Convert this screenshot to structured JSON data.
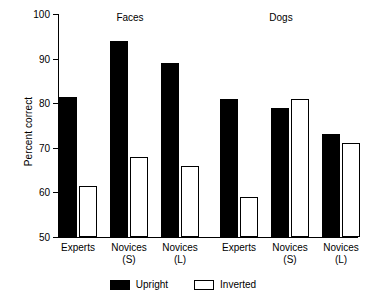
{
  "chart_data": {
    "type": "bar",
    "title": "",
    "xlabel": "",
    "ylabel": "Percent correct",
    "ylim": [
      50,
      100
    ],
    "yticks": [
      50,
      60,
      70,
      80,
      90,
      100
    ],
    "grid": false,
    "legend_position": "bottom-center",
    "groups": [
      {
        "name": "Faces",
        "categories": [
          "Experts",
          "Novices\n(S)",
          "Novices\n(L)"
        ]
      },
      {
        "name": "Dogs",
        "categories": [
          "Experts",
          "Novices\n(S)",
          "Novices\n(L)"
        ]
      }
    ],
    "categories": [
      "Faces / Experts",
      "Faces / Novices (S)",
      "Faces / Novices (L)",
      "Dogs / Experts",
      "Dogs / Novices (S)",
      "Dogs / Novices (L)"
    ],
    "series": [
      {
        "name": "Upright",
        "color": "#000000",
        "values": [
          81.5,
          94,
          89,
          81,
          79,
          73
        ]
      },
      {
        "name": "Inverted",
        "color": "#ffffff",
        "values": [
          61.5,
          68,
          66,
          59,
          81,
          71
        ]
      }
    ]
  },
  "axis": {
    "y_label": "Percent correct",
    "y_ticks": [
      "100",
      "90",
      "80",
      "70",
      "60",
      "50"
    ],
    "x_labels": [
      {
        "line1": "Experts",
        "line2": ""
      },
      {
        "line1": "Novices",
        "line2": "(S)"
      },
      {
        "line1": "Novices",
        "line2": "(L)"
      },
      {
        "line1": "Experts",
        "line2": ""
      },
      {
        "line1": "Novices",
        "line2": "(S)"
      },
      {
        "line1": "Novices",
        "line2": "(L)"
      }
    ]
  },
  "group_titles": [
    "Faces",
    "Dogs"
  ],
  "legend": {
    "items": [
      {
        "label": "Upright",
        "color": "#000000"
      },
      {
        "label": "Inverted",
        "color": "#ffffff"
      }
    ]
  }
}
